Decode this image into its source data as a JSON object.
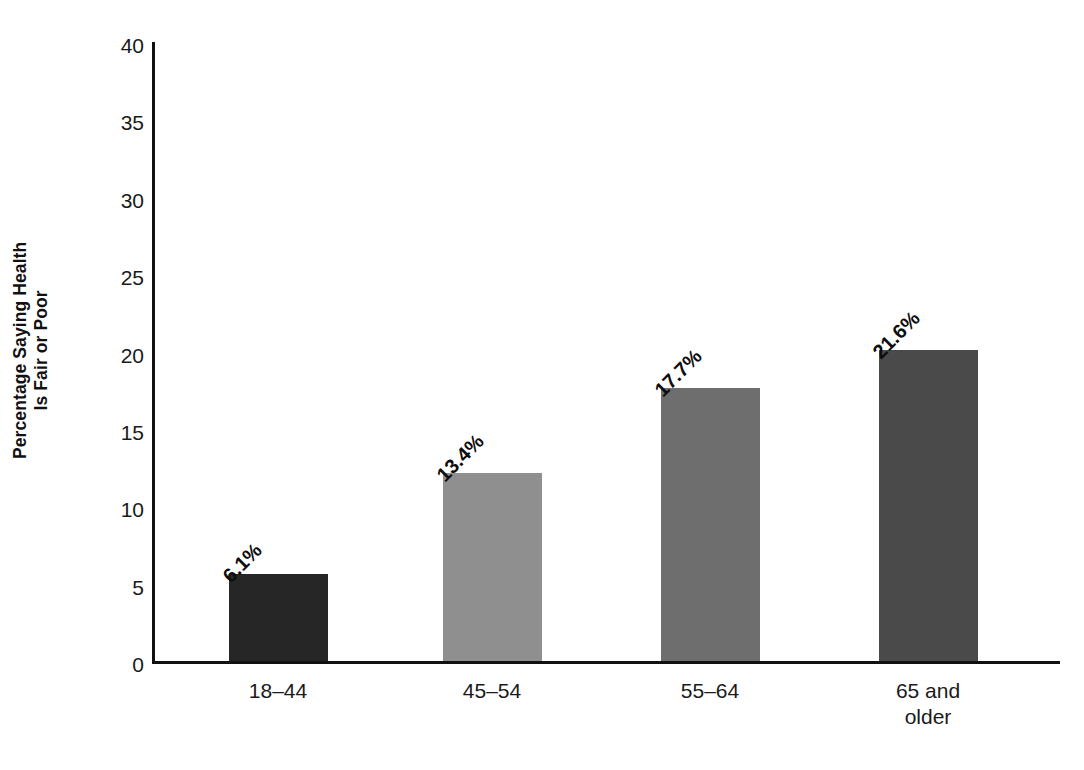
{
  "chart_data": {
    "type": "bar",
    "title": "",
    "subtitle": "",
    "xlabel": "",
    "ylabel": "Percentage Saying Health Is Fair or Poor",
    "ylabel_line1": "Percentage Saying Health",
    "ylabel_line2": "Is Fair or Poor",
    "categories": [
      "18–44",
      "45–54",
      "55–64",
      "65 and older"
    ],
    "category_lines": [
      [
        "18–44"
      ],
      [
        "45–54"
      ],
      [
        "55–64"
      ],
      [
        "65 and",
        "older"
      ]
    ],
    "values": [
      6.1,
      13.4,
      17.7,
      21.6
    ],
    "data_labels": [
      "6.1%",
      "13.4%",
      "17.7%",
      "21.6%"
    ],
    "bar_colors": [
      "#262626",
      "#8f8f8f",
      "#6e6e6e",
      "#4a4a4a"
    ],
    "ylim": [
      0,
      40
    ],
    "y_ticks": [
      0,
      5,
      10,
      15,
      20,
      25,
      30,
      35,
      40
    ],
    "y_tick_labels": [
      "0",
      "5",
      "10",
      "15",
      "20",
      "25",
      "30",
      "35",
      "40"
    ],
    "grid": false,
    "legend": "none",
    "axis_color": "#111111",
    "background_color": "#ffffff",
    "data_label_rotation_deg": -45
  }
}
